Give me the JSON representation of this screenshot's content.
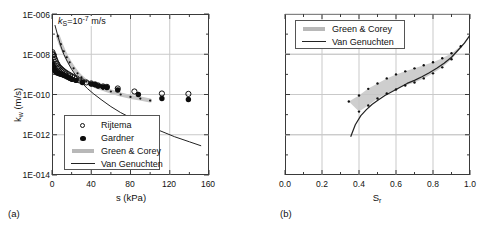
{
  "figure": {
    "background": "#ffffff",
    "gridcolor": "#c9c9c9",
    "axiscolor": "#3a3a3a",
    "bandcolor": "#c6c6c6",
    "linecolor": "#222222"
  },
  "panel_a": {
    "label": "(a)",
    "annotation_prefix": "k",
    "annotation_sub": "S",
    "annotation_mid": "=10",
    "annotation_sup": "-7",
    "annotation_suffix": " m/s",
    "annotation_full": "kS=10-7 m/s",
    "xlabel": "s (kPa)",
    "ylabel_main": "k",
    "ylabel_sub": "w",
    "ylabel_unit": " (m/s)",
    "ylabel_full": "kw (m/s)",
    "xticks": [
      "0",
      "40",
      "80",
      "120",
      "160"
    ],
    "yticks": [
      "1E-006",
      "1E-008",
      "1E-010",
      "1E-012",
      "1E-014"
    ],
    "legend": [
      {
        "label": "Rijtema",
        "symbol": "open-circle"
      },
      {
        "label": "Gardner",
        "symbol": "filled-circle"
      },
      {
        "label": "Green & Corey",
        "symbol": "thick-gray-line"
      },
      {
        "label": "Van Genuchten",
        "symbol": "thin-black-line"
      }
    ]
  },
  "panel_b": {
    "label": "(b)",
    "xlabel_main": "S",
    "xlabel_sub": "r",
    "xlabel_full": "Sr",
    "xticks": [
      "0.0",
      "0.2",
      "0.4",
      "0.6",
      "0.8",
      "1.0"
    ],
    "legend": [
      {
        "label": "Green & Corey",
        "symbol": "thick-gray-line"
      },
      {
        "label": "Van Genuchten",
        "symbol": "thin-black-line"
      }
    ]
  },
  "chart_data": [
    {
      "type": "scatter",
      "panel": "a",
      "title": "",
      "xlabel": "s (kPa)",
      "ylabel": "kw (m/s)",
      "xlim": [
        0,
        160
      ],
      "ylim_log10": [
        -14,
        -6
      ],
      "yscale": "log",
      "grid": true,
      "annotation": "kS=10^-7 m/s",
      "xticks": [
        0,
        40,
        80,
        120,
        160
      ],
      "yticks_log10": [
        -6,
        -8,
        -10,
        -12,
        -14
      ],
      "series": [
        {
          "name": "Rijtema",
          "style": "open-circle",
          "points": [
            [
              0.5,
              -7.9
            ],
            [
              1.0,
              -8.0
            ],
            [
              1.6,
              -8.05
            ],
            [
              2.2,
              -8.15
            ],
            [
              3.0,
              -8.25
            ],
            [
              3.8,
              -8.35
            ],
            [
              4.6,
              -8.45
            ],
            [
              5.5,
              -8.5
            ],
            [
              6.4,
              -8.6
            ],
            [
              7.4,
              -8.65
            ],
            [
              8.5,
              -8.7
            ],
            [
              9.6,
              -8.75
            ],
            [
              10.8,
              -8.8
            ],
            [
              12.0,
              -8.85
            ],
            [
              13.5,
              -8.9
            ],
            [
              15.0,
              -8.95
            ],
            [
              16.8,
              -9.0
            ],
            [
              18.5,
              -9.05
            ],
            [
              20.5,
              -9.1
            ],
            [
              22.5,
              -9.15
            ],
            [
              25.0,
              -9.2
            ],
            [
              28.0,
              -9.3
            ],
            [
              31.0,
              -9.35
            ],
            [
              35.0,
              -9.4
            ],
            [
              40.0,
              -9.45
            ],
            [
              44.0,
              -9.5
            ],
            [
              47.0,
              -9.55
            ],
            [
              52.0,
              -9.6
            ],
            [
              56.0,
              -9.62
            ],
            [
              67.0,
              -9.7
            ],
            [
              84.0,
              -9.85
            ],
            [
              112.0,
              -9.95
            ],
            [
              139.0,
              -9.97
            ]
          ]
        },
        {
          "name": "Gardner",
          "style": "filled-circle",
          "points": [
            [
              0.6,
              -8.5
            ],
            [
              1.3,
              -8.6
            ],
            [
              2.0,
              -8.72
            ],
            [
              2.8,
              -8.8
            ],
            [
              3.6,
              -8.86
            ],
            [
              4.5,
              -8.9
            ],
            [
              5.4,
              -8.93
            ],
            [
              6.4,
              -8.95
            ],
            [
              7.5,
              -8.97
            ],
            [
              8.6,
              -8.98
            ],
            [
              9.8,
              -9.0
            ],
            [
              11.0,
              -9.02
            ],
            [
              12.3,
              -9.05
            ],
            [
              13.7,
              -9.08
            ],
            [
              15.2,
              -9.12
            ],
            [
              16.8,
              -9.16
            ],
            [
              18.5,
              -9.2
            ],
            [
              20.5,
              -9.25
            ],
            [
              24.5,
              -9.3
            ],
            [
              31.0,
              -9.4
            ],
            [
              40.0,
              -9.48
            ],
            [
              43.5,
              -9.5
            ],
            [
              47.0,
              -9.58
            ],
            [
              52.0,
              -9.62
            ],
            [
              56.0,
              -9.65
            ],
            [
              67.0,
              -9.78
            ],
            [
              88.0,
              -10.0
            ],
            [
              112.0,
              -10.2
            ],
            [
              139.0,
              -10.25
            ]
          ]
        },
        {
          "name": "Green & Corey",
          "style": "thick-gray-band",
          "points": [
            [
              6.0,
              -7.1
            ],
            [
              9.0,
              -7.5
            ],
            [
              12.0,
              -7.85
            ],
            [
              15.0,
              -8.15
            ],
            [
              18.0,
              -8.4
            ],
            [
              22.0,
              -8.7
            ],
            [
              26.0,
              -8.95
            ],
            [
              30.0,
              -9.15
            ],
            [
              35.0,
              -9.35
            ],
            [
              40.0,
              -9.5
            ],
            [
              46.0,
              -9.62
            ],
            [
              52.0,
              -9.72
            ],
            [
              60.0,
              -9.85
            ],
            [
              70.0,
              -10.0
            ],
            [
              80.0,
              -10.12
            ],
            [
              90.0,
              -10.2
            ],
            [
              100.0,
              -10.3
            ]
          ]
        },
        {
          "name": "Van Genuchten",
          "style": "thin-black-line",
          "points": [
            [
              3.0,
              -6.55
            ],
            [
              6.0,
              -7.1
            ],
            [
              9.0,
              -7.6
            ],
            [
              12.0,
              -8.0
            ],
            [
              16.0,
              -8.4
            ],
            [
              20.0,
              -8.75
            ],
            [
              25.0,
              -9.1
            ],
            [
              30.0,
              -9.4
            ],
            [
              36.0,
              -9.7
            ],
            [
              42.0,
              -9.95
            ],
            [
              50.0,
              -10.25
            ],
            [
              60.0,
              -10.6
            ],
            [
              70.0,
              -10.9
            ],
            [
              82.0,
              -11.2
            ],
            [
              95.0,
              -11.5
            ],
            [
              110.0,
              -11.8
            ],
            [
              125.0,
              -12.1
            ],
            [
              140.0,
              -12.35
            ],
            [
              152.0,
              -12.55
            ]
          ]
        }
      ]
    },
    {
      "type": "line",
      "panel": "b",
      "title": "",
      "xlabel": "Sr",
      "ylabel": "",
      "xlim": [
        0.0,
        1.0
      ],
      "ylim_log10": [
        -14,
        -6
      ],
      "yscale": "log",
      "grid": true,
      "xticks": [
        0.0,
        0.2,
        0.4,
        0.6,
        0.8,
        1.0
      ],
      "series": [
        {
          "name": "Green & Corey",
          "style": "gray-band",
          "upper": [
            [
              0.345,
              -10.35
            ],
            [
              0.4,
              -10.05
            ],
            [
              0.45,
              -9.7
            ],
            [
              0.5,
              -9.45
            ],
            [
              0.55,
              -9.2
            ],
            [
              0.6,
              -9.0
            ],
            [
              0.65,
              -8.85
            ],
            [
              0.7,
              -8.7
            ],
            [
              0.75,
              -8.55
            ],
            [
              0.8,
              -8.4
            ],
            [
              0.85,
              -8.2
            ],
            [
              0.9,
              -7.95
            ],
            [
              0.95,
              -7.6
            ],
            [
              1.0,
              -7.05
            ]
          ],
          "lower": [
            [
              0.345,
              -10.35
            ],
            [
              0.4,
              -10.85
            ],
            [
              0.45,
              -10.55
            ],
            [
              0.5,
              -10.2
            ],
            [
              0.55,
              -9.95
            ],
            [
              0.6,
              -9.75
            ],
            [
              0.65,
              -9.55
            ],
            [
              0.7,
              -9.4
            ],
            [
              0.75,
              -9.2
            ],
            [
              0.8,
              -8.95
            ],
            [
              0.85,
              -8.65
            ],
            [
              0.9,
              -8.25
            ],
            [
              0.95,
              -7.7
            ],
            [
              1.0,
              -7.05
            ]
          ]
        },
        {
          "name": "Van Genuchten",
          "style": "thin-black-line",
          "points": [
            [
              0.355,
              -12.1
            ],
            [
              0.38,
              -11.5
            ],
            [
              0.41,
              -11.05
            ],
            [
              0.44,
              -10.75
            ],
            [
              0.47,
              -10.5
            ],
            [
              0.5,
              -10.3
            ],
            [
              0.54,
              -10.05
            ],
            [
              0.58,
              -9.85
            ],
            [
              0.62,
              -9.65
            ],
            [
              0.66,
              -9.45
            ],
            [
              0.7,
              -9.3
            ],
            [
              0.74,
              -9.12
            ],
            [
              0.78,
              -8.92
            ],
            [
              0.82,
              -8.7
            ],
            [
              0.86,
              -8.45
            ],
            [
              0.9,
              -8.15
            ],
            [
              0.94,
              -7.75
            ],
            [
              0.97,
              -7.45
            ],
            [
              1.0,
              -7.05
            ]
          ]
        },
        {
          "name": "band-markers",
          "style": "small-dots",
          "points": [
            [
              0.345,
              -10.35
            ],
            [
              0.4,
              -10.05
            ],
            [
              0.4,
              -10.85
            ],
            [
              0.45,
              -9.72
            ],
            [
              0.45,
              -10.55
            ],
            [
              0.5,
              -9.45
            ],
            [
              0.5,
              -10.2
            ],
            [
              0.55,
              -9.2
            ],
            [
              0.55,
              -9.95
            ],
            [
              0.6,
              -9.0
            ],
            [
              0.6,
              -9.75
            ],
            [
              0.65,
              -8.85
            ],
            [
              0.65,
              -9.55
            ],
            [
              0.7,
              -8.7
            ],
            [
              0.7,
              -9.4
            ],
            [
              0.75,
              -8.55
            ],
            [
              0.75,
              -9.2
            ],
            [
              0.8,
              -8.4
            ],
            [
              0.8,
              -8.95
            ],
            [
              0.85,
              -8.2
            ],
            [
              0.85,
              -8.65
            ],
            [
              0.9,
              -7.95
            ],
            [
              0.9,
              -8.25
            ],
            [
              0.95,
              -7.6
            ]
          ]
        }
      ]
    }
  ]
}
